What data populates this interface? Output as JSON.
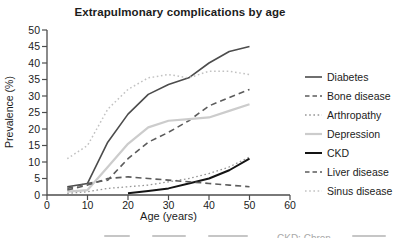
{
  "chart_data": {
    "type": "line",
    "title": "Extrapulmonary complications by age",
    "xlabel": "Age (years)",
    "ylabel": "Prevalence (%)",
    "x": [
      5,
      10,
      15,
      20,
      25,
      30,
      35,
      40,
      45,
      50
    ],
    "xlim": [
      0,
      60
    ],
    "ylim": [
      0,
      50
    ],
    "xticks": [
      0,
      10,
      20,
      30,
      40,
      50,
      60
    ],
    "yticks": [
      0,
      5,
      10,
      15,
      20,
      25,
      30,
      35,
      40,
      45,
      50
    ],
    "grid": false,
    "legend_position": "right",
    "axis_color": "#4d4d4d",
    "tick_label_color": "#1c1c1c",
    "series": [
      {
        "name": "Diabetes",
        "style": "solid",
        "color": "#4c4c4c",
        "width": 1.6,
        "values": [
          2.5,
          3.5,
          16,
          24.5,
          30.5,
          33.5,
          35.5,
          40,
          43.5,
          45
        ]
      },
      {
        "name": "Bone disease",
        "style": "dashed",
        "color": "#5c5c5c",
        "width": 1.6,
        "values": [
          2,
          3.5,
          4.5,
          11,
          16,
          19,
          22.5,
          27,
          29.5,
          32
        ]
      },
      {
        "name": "Arthropathy",
        "style": "dotted",
        "color": "#969696",
        "width": 1.3,
        "values": [
          0.5,
          1,
          2,
          2.5,
          3,
          4,
          5,
          6.5,
          8.5,
          11.5
        ]
      },
      {
        "name": "Depression",
        "style": "solid",
        "color": "#cccccc",
        "width": 2.2,
        "values": [
          1,
          1.5,
          8.5,
          15.5,
          20.5,
          22.5,
          23,
          23.5,
          25.5,
          27.5
        ]
      },
      {
        "name": "CKD",
        "style": "solid",
        "color": "#141414",
        "width": 2.0,
        "values": [
          null,
          null,
          null,
          0.5,
          1.2,
          2,
          3.5,
          5,
          7.5,
          11
        ]
      },
      {
        "name": "Liver disease",
        "style": "dashed",
        "color": "#5c5c5c",
        "width": 1.6,
        "values": [
          1.5,
          3,
          5,
          5.5,
          5,
          4.5,
          4,
          3.5,
          3,
          2.5
        ]
      },
      {
        "name": "Sinus disease",
        "style": "dotted",
        "color": "#c2c2c2",
        "width": 1.5,
        "values": [
          11,
          15,
          26,
          32,
          35.5,
          36.5,
          35.5,
          37.5,
          37.5,
          36.5
        ]
      }
    ]
  },
  "footer": {
    "fragment": "CKD: Chron"
  }
}
